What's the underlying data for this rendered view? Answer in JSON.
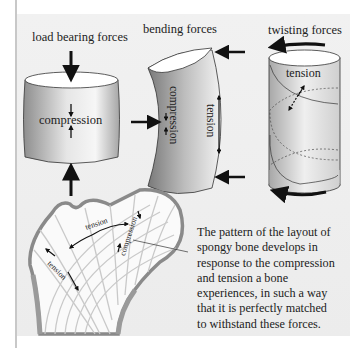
{
  "figure": {
    "headings": {
      "load": "load bearing forces",
      "bending": "bending forces",
      "twisting": "twisting forces"
    },
    "labels": {
      "compression_load": "compression",
      "compression_bend": "compression",
      "tension_bend": "tension",
      "tension_twist": "tension",
      "femur_tension_upper": "tension",
      "femur_tension_lower": "tension",
      "femur_compression": "compression"
    },
    "caption_lines": [
      "The pattern of the layout of",
      "spongy bone develops in",
      "response to the compression",
      "and tension a bone",
      "experiences, in such a way",
      "that it is perfectly matched",
      "to withstand these forces."
    ],
    "colors": {
      "background": "#eeeeee",
      "bone_gray": "#9a9a9a",
      "trabecula": "#c9c9c9",
      "arrow": "#111111"
    }
  }
}
